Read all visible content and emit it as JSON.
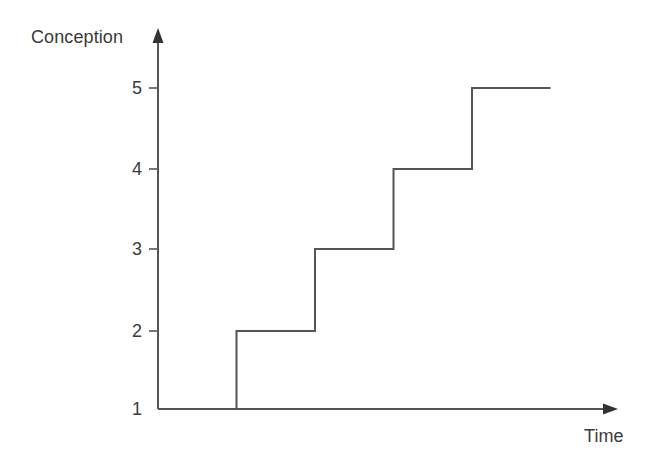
{
  "chart_data": {
    "type": "line",
    "subtype": "step",
    "title": "",
    "xlabel": "Time",
    "ylabel": "Conception",
    "grid": false,
    "legend": null,
    "line_color": "#555555",
    "axis_color": "#555555",
    "background": "#ffffff",
    "ytick_labels": [
      "1",
      "2",
      "3",
      "4",
      "5"
    ],
    "ytick_values": [
      1,
      2,
      3,
      4,
      5
    ],
    "xtick_labels": [],
    "ylim": [
      1,
      5.6
    ],
    "xlim": [
      0,
      10
    ],
    "x": [
      0,
      1,
      1,
      2,
      2,
      3,
      3,
      4,
      4,
      5,
      5,
      6
    ],
    "y": [
      1,
      1,
      2,
      2,
      3,
      3,
      4,
      4,
      5,
      5,
      5,
      5
    ],
    "steps": [
      {
        "level": 1,
        "x_start": 0.0,
        "x_end": 1.0
      },
      {
        "level": 2,
        "x_start": 1.0,
        "x_end": 2.0
      },
      {
        "level": 3,
        "x_start": 2.0,
        "x_end": 3.0
      },
      {
        "level": 4,
        "x_start": 3.0,
        "x_end": 4.0
      },
      {
        "level": 5,
        "x_start": 4.0,
        "x_end": 5.0
      }
    ],
    "annotations": []
  },
  "axes": {
    "y_axis_label": "Conception",
    "x_axis_label": "Time"
  },
  "ticks": {
    "y": [
      {
        "label": "5"
      },
      {
        "label": "4"
      },
      {
        "label": "3"
      },
      {
        "label": "2"
      },
      {
        "label": "1"
      }
    ]
  },
  "icons": {
    "y_axis_arrow": "arrow-up-icon",
    "x_axis_arrow": "arrow-right-icon"
  }
}
